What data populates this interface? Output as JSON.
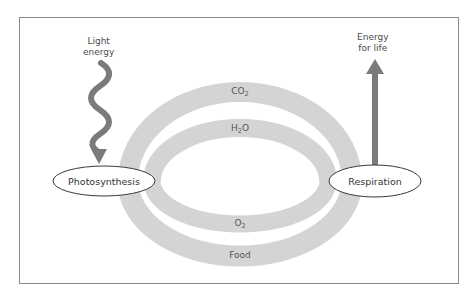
{
  "diagram": {
    "type": "cycle",
    "nodes": [
      {
        "id": "photosynthesis",
        "label": "Photosynthesis"
      },
      {
        "id": "respiration",
        "label": "Respiration"
      }
    ],
    "inputs": {
      "light_energy": {
        "line1": "Light",
        "line2": "energy",
        "target": "photosynthesis",
        "icon": "wavy-arrow"
      }
    },
    "outputs": {
      "energy_for_life": {
        "line1": "Energy",
        "line2": "for life",
        "source": "respiration",
        "icon": "straight-arrow"
      }
    },
    "flows": [
      {
        "id": "co2",
        "base": "CO",
        "sub": "2",
        "from": "respiration",
        "to": "photosynthesis",
        "position": "top-outer"
      },
      {
        "id": "h2o",
        "base": "H",
        "sub": "2",
        "suffix": "O",
        "from": "respiration",
        "to": "photosynthesis",
        "position": "top-inner"
      },
      {
        "id": "o2",
        "base": "O",
        "sub": "2",
        "from": "photosynthesis",
        "to": "respiration",
        "position": "bottom-inner"
      },
      {
        "id": "food",
        "base": "Food",
        "from": "photosynthesis",
        "to": "respiration",
        "position": "bottom-outer"
      }
    ],
    "colors": {
      "band": "#d4d4d4",
      "arrow": "#7b7b7b",
      "frame": "#8a8a8a",
      "text": "#4a4a4a"
    }
  }
}
